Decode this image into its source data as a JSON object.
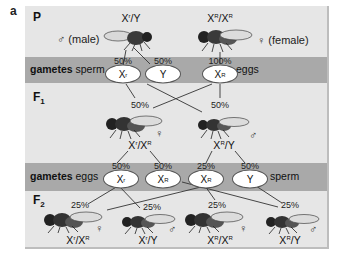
{
  "panel_label": "a",
  "generations": {
    "P": {
      "label": "P",
      "male": {
        "genotype_base": "X",
        "genotype_sup": "r",
        "genotype_rest": "/Y",
        "sex_symbol": "♂",
        "sex_text": "(male)"
      },
      "female": {
        "genotype_base": "X",
        "genotype_sup": "R",
        "genotype_mid": "/X",
        "genotype_sup2": "R",
        "sex_symbol": "♀",
        "sex_text": "(female)"
      }
    },
    "gametes_1": {
      "label_bold": "gametes",
      "label_left": "sperm",
      "label_right": "eggs",
      "items": [
        {
          "pct": "50%",
          "allele": "X",
          "sup": "r"
        },
        {
          "pct": "50%",
          "allele": "Y",
          "sup": ""
        },
        {
          "pct": "100%",
          "allele": "X",
          "sup": "R"
        }
      ]
    },
    "F1": {
      "label": "F",
      "label_sub": "1",
      "offspring": [
        {
          "pct": "50%",
          "genotype": "Xr/XR",
          "g1": "X",
          "s1": "r",
          "g2": "/X",
          "s2": "R",
          "g3": "",
          "sex_symbol": "♀"
        },
        {
          "pct": "50%",
          "genotype": "XR/Y",
          "g1": "X",
          "s1": "R",
          "g2": "/Y",
          "s2": "",
          "g3": "",
          "sex_symbol": "♂"
        }
      ]
    },
    "gametes_2": {
      "label_bold": "gametes",
      "label_left": "eggs",
      "label_right": "sperm",
      "items": [
        {
          "pct": "50%",
          "allele": "X",
          "sup": "r"
        },
        {
          "pct": "50%",
          "allele": "X",
          "sup": "R"
        },
        {
          "pct": "25%",
          "allele": "X",
          "sup": "R"
        },
        {
          "pct": "50%",
          "allele": "Y",
          "sup": ""
        }
      ]
    },
    "F2": {
      "label": "F",
      "label_sub": "2",
      "offspring": [
        {
          "pct": "25%",
          "g1": "X",
          "s1": "r",
          "g2": "/X",
          "s2": "R",
          "sex_symbol": "♀"
        },
        {
          "pct": "25%",
          "g1": "X",
          "s1": "r",
          "g2": "/Y",
          "s2": "",
          "sex_symbol": "♂"
        },
        {
          "pct": "25%",
          "g1": "X",
          "s1": "R",
          "g2": "/X",
          "s2": "R",
          "sex_symbol": "♀"
        },
        {
          "pct": "25%",
          "g1": "X",
          "s1": "R",
          "g2": "/Y",
          "s2": "",
          "sex_symbol": "♂"
        }
      ]
    }
  },
  "colors": {
    "panel_bg": "#e6e6e6",
    "band_bg": "#a9a9a9",
    "oval_bg": "#ffffff",
    "line": "#333333"
  }
}
